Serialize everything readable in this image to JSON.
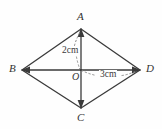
{
  "figure": {
    "name": "rhombus-with-diagonals",
    "background_color": "#fefefe",
    "stroke_color": "#3a3a3a",
    "dashed_color": "#8a8a8a",
    "canvas": {
      "width": 162,
      "height": 129
    }
  },
  "vertices": [
    {
      "id": "A",
      "label": "A",
      "x": 81,
      "y": 29,
      "label_x": 77,
      "label_y": 11
    },
    {
      "id": "B",
      "label": "B",
      "x": 22,
      "y": 70,
      "label_x": 9,
      "label_y": 63
    },
    {
      "id": "C",
      "label": "C",
      "x": 81,
      "y": 108,
      "label_x": 77,
      "label_y": 112
    },
    {
      "id": "D",
      "label": "D",
      "x": 140,
      "y": 70,
      "label_x": 146,
      "label_y": 63
    },
    {
      "id": "O",
      "label": "O",
      "x": 81,
      "y": 70,
      "label_x": 72,
      "label_y": 72
    }
  ],
  "edges": [
    {
      "from": "A",
      "to": "B",
      "style": "solid"
    },
    {
      "from": "B",
      "to": "C",
      "style": "solid"
    },
    {
      "from": "C",
      "to": "D",
      "style": "solid"
    },
    {
      "from": "D",
      "to": "A",
      "style": "solid"
    }
  ],
  "diagonals": [
    {
      "from": "B",
      "to": "D",
      "style": "solid",
      "arrows": "both"
    },
    {
      "from": "A",
      "to": "C",
      "style": "solid",
      "arrows": "both"
    }
  ],
  "measurements": [
    {
      "id": "AO",
      "text": "2cm",
      "segment": "AO",
      "label_x": 61,
      "label_y": 46,
      "leader": "dotted from A down to O passing left of the vertical diagonal"
    },
    {
      "id": "OD",
      "text": "3cm",
      "segment": "OD",
      "label_x": 99,
      "label_y": 70,
      "leader": "dotted from O rightwards to D"
    }
  ]
}
